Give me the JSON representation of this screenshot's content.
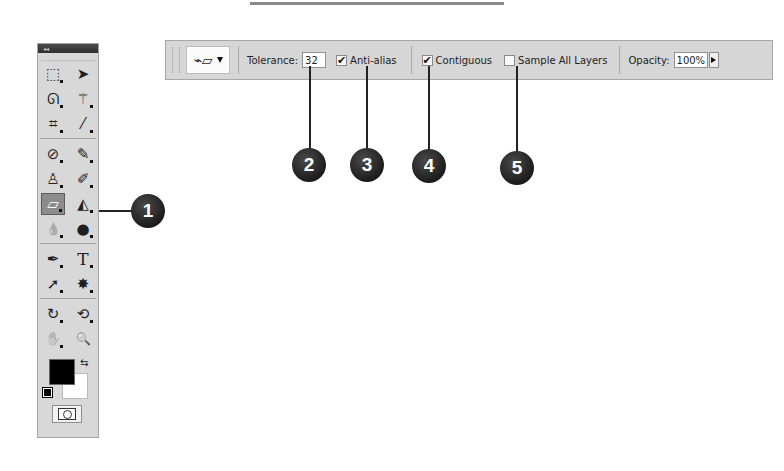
{
  "options_bar": {
    "tool_preset_icon": "eraser-icon",
    "tolerance_label": "Tolerance:",
    "tolerance_value": "32",
    "anti_alias": {
      "label": "Anti-alias",
      "checked": true,
      "mark": "✔"
    },
    "contiguous": {
      "label": "Contiguous",
      "checked": true,
      "mark": "✔"
    },
    "sample_all_layers": {
      "label": "Sample All Layers",
      "checked": false,
      "mark": ""
    },
    "opacity_label": "Opacity:",
    "opacity_value": "100%"
  },
  "callouts": [
    {
      "number": "1",
      "target": "magic-eraser-tool"
    },
    {
      "number": "2",
      "target": "tolerance"
    },
    {
      "number": "3",
      "target": "anti-alias"
    },
    {
      "number": "4",
      "target": "contiguous"
    },
    {
      "number": "5",
      "target": "sample-all-layers"
    }
  ],
  "toolbox": {
    "header": "◂◂",
    "tools": [
      {
        "name": "marquee-tool",
        "glyph": "⬚"
      },
      {
        "name": "move-tool",
        "glyph": "➤"
      },
      {
        "name": "lasso-tool",
        "glyph": "ᘏ"
      },
      {
        "name": "magic-wand-tool",
        "glyph": "⚚"
      },
      {
        "name": "crop-tool",
        "glyph": "⌗"
      },
      {
        "name": "eyedropper-tool",
        "glyph": "⁄"
      },
      {
        "name": "healing-brush-tool",
        "glyph": "⊘"
      },
      {
        "name": "brush-tool",
        "glyph": "✎"
      },
      {
        "name": "clone-stamp-tool",
        "glyph": "♙"
      },
      {
        "name": "history-brush-tool",
        "glyph": "✐"
      },
      {
        "name": "magic-eraser-tool",
        "glyph": "▱"
      },
      {
        "name": "paint-bucket-tool",
        "glyph": "◭"
      },
      {
        "name": "blur-tool",
        "glyph": "💧"
      },
      {
        "name": "dodge-tool",
        "glyph": "●"
      },
      {
        "name": "pen-tool",
        "glyph": "✒"
      },
      {
        "name": "type-tool",
        "glyph": "T"
      },
      {
        "name": "path-selection-tool",
        "glyph": "➚"
      },
      {
        "name": "custom-shape-tool",
        "glyph": "✸"
      },
      {
        "name": "3d-rotate-tool",
        "glyph": "↻"
      },
      {
        "name": "3d-orbit-tool",
        "glyph": "⟲"
      },
      {
        "name": "hand-tool",
        "glyph": "✋"
      },
      {
        "name": "zoom-tool",
        "glyph": "🔍"
      }
    ],
    "foreground_color": "#000000",
    "background_color": "#ffffff",
    "swap_glyph": "⇆"
  },
  "colors": {
    "bar_bg": "#d6d6d6",
    "callout_bg": "#222222"
  }
}
